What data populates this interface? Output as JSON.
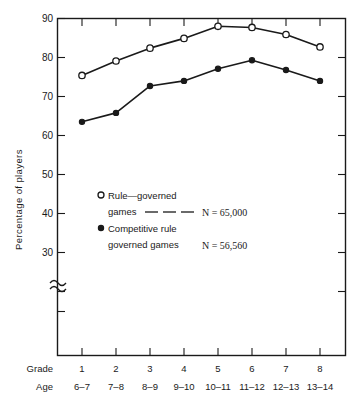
{
  "chart_data": {
    "type": "line",
    "title": "",
    "xlabel": "Grade",
    "ylabel": "Percentage of players",
    "categories": [
      "1",
      "2",
      "3",
      "4",
      "5",
      "6",
      "7",
      "8"
    ],
    "secondary_categories": [
      "6–7",
      "7–8",
      "8–9",
      "9–10",
      "10–11",
      "11–12",
      "12–13",
      "13–14"
    ],
    "secondary_axis_label": "Age",
    "ylim": [
      26,
      90
    ],
    "yticks": [
      30,
      40,
      50,
      60,
      70,
      80,
      90
    ],
    "ytick_labels": [
      "30",
      "40",
      "50",
      "60",
      "70",
      "80",
      "90"
    ],
    "y_axis_break": true,
    "grid": false,
    "legend_position": "inside-center-left",
    "series": [
      {
        "name": "Rule—governed games",
        "marker": "open-circle",
        "n_label": "N  =  65,000",
        "values": [
          75.4,
          79.1,
          82.4,
          84.9,
          88.0,
          87.7,
          85.9,
          82.7
        ]
      },
      {
        "name": "Competitive rule governed games",
        "marker": "filled-circle",
        "n_label": "N  =  56,560",
        "values": [
          63.5,
          65.8,
          72.7,
          74.0,
          77.1,
          79.3,
          76.8,
          74.0
        ]
      }
    ]
  },
  "axes": {
    "y_title": "Percentage of players",
    "grade_row_label": "Grade",
    "age_row_label": "Age"
  },
  "legend": {
    "entry1": {
      "line1": "Rule—governed",
      "line2": "games",
      "n": "N  =  65,000",
      "marker": "open-circle"
    },
    "entry2": {
      "line1": "Competitive rule",
      "line2": "governed games",
      "n": "N  =  56,560",
      "marker": "filled-circle"
    }
  },
  "colors": {
    "ink": "#1a1a1a",
    "background": "#ffffff"
  }
}
